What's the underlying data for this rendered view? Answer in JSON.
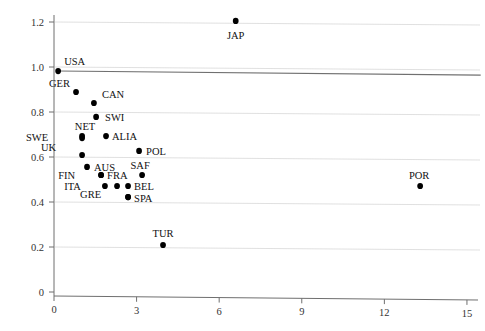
{
  "chart_data": {
    "type": "scatter",
    "title": "",
    "xlabel": "",
    "ylabel": "",
    "xlim": [
      0,
      15
    ],
    "ylim": [
      0,
      1.27
    ],
    "xticks": [
      0,
      3,
      6,
      9,
      12,
      15
    ],
    "xticklabels": [
      "0",
      "3",
      "6",
      "9",
      "12",
      "15"
    ],
    "yticks": [
      0,
      0.2,
      0.4,
      0.6,
      0.8,
      1.0,
      1.2
    ],
    "yticklabels": [
      "0",
      "0.2",
      "0.4",
      "0.6",
      "0.8",
      "1.0",
      "1.2"
    ],
    "grid": "horizontal",
    "legend": "none",
    "reference_line": {
      "name": "reference-line",
      "x0": 0.14,
      "y0": 0.982,
      "x1": 15.5,
      "y1": 0.964,
      "color": "#707070"
    },
    "point_color": "#000000",
    "points": [
      {
        "label": "JAP",
        "x": 6.6,
        "y": 1.205,
        "label_dx": 0,
        "label_dy": 18
      },
      {
        "label": "USA",
        "x": 0.15,
        "y": 0.982,
        "label_dx": 6,
        "label_dy": -6
      },
      {
        "label": "GER",
        "x": 0.8,
        "y": 0.889,
        "label_dx": -6,
        "label_dy": -5
      },
      {
        "label": "CAN",
        "x": 1.45,
        "y": 0.84,
        "label_dx": 8,
        "label_dy": -5
      },
      {
        "label": "SWI",
        "x": 1.53,
        "y": 0.778,
        "label_dx": 9,
        "label_dy": 4
      },
      {
        "label": "NET",
        "x": 1.02,
        "y": 0.693,
        "label_dx": 3,
        "label_dy": -6
      },
      {
        "label": "SWE",
        "x": 1.02,
        "y": 0.684,
        "label_dx": -34,
        "label_dy": 3
      },
      {
        "label": "ALIA",
        "x": 1.89,
        "y": 0.693,
        "label_dx": 6,
        "label_dy": 4
      },
      {
        "label": "UK",
        "x": 1.02,
        "y": 0.609,
        "label_dx": -26,
        "label_dy": -4
      },
      {
        "label": "POL",
        "x": 3.09,
        "y": 0.627,
        "label_dx": 7,
        "label_dy": 4
      },
      {
        "label": "AUS",
        "x": 1.2,
        "y": 0.556,
        "label_dx": 7,
        "label_dy": 4
      },
      {
        "label": "SAF",
        "x": 3.2,
        "y": 0.52,
        "label_dx": -2,
        "label_dy": -6
      },
      {
        "label": "FRA",
        "x": 1.71,
        "y": 0.52,
        "label_dx": 6,
        "label_dy": 4
      },
      {
        "label": "FIN",
        "x": 1.71,
        "y": 0.52,
        "label_dx": -26,
        "label_dy": 4
      },
      {
        "label": "BEL",
        "x": 2.69,
        "y": 0.471,
        "label_dx": 6,
        "label_dy": 4
      },
      {
        "label": "ITA",
        "x": 1.85,
        "y": 0.471,
        "label_dx": -24,
        "label_dy": 4
      },
      {
        "label": "",
        "x": 2.29,
        "y": 0.471,
        "label_dx": 0,
        "label_dy": 0
      },
      {
        "label": "SPA",
        "x": 2.69,
        "y": 0.422,
        "label_dx": 6,
        "label_dy": 5
      },
      {
        "label": "GRE",
        "x": 2.69,
        "y": 0.422,
        "label_dx": -27,
        "label_dy": 1
      },
      {
        "label": "POR",
        "x": 13.3,
        "y": 0.471,
        "label_dx": -1,
        "label_dy": -7
      },
      {
        "label": "TUR",
        "x": 3.96,
        "y": 0.209,
        "label_dx": 0,
        "label_dy": -8
      }
    ]
  }
}
